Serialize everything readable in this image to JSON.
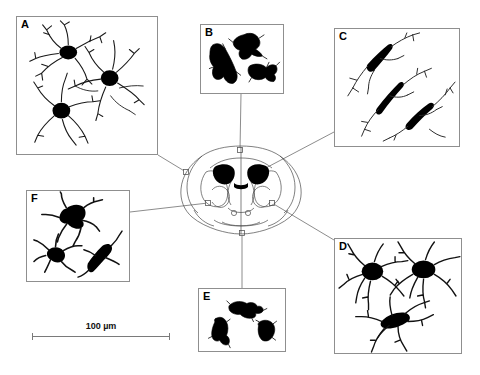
{
  "figure": {
    "background_color": "#ffffff",
    "ink_color": "#000000",
    "border_color": "#8f8f8f",
    "leader_color": "#6e6e6e"
  },
  "scale": {
    "label": "100 µm",
    "value": 100,
    "unit": "µm",
    "bar_length_px": 138
  },
  "panels": [
    {
      "id": "A",
      "label": "A",
      "morphology": "ramified",
      "cell_count": 3,
      "x": 16,
      "y": 16,
      "w": 142,
      "h": 139
    },
    {
      "id": "B",
      "label": "B",
      "morphology": "amoeboid-stout",
      "cell_count": 3,
      "x": 200,
      "y": 24,
      "w": 84,
      "h": 70
    },
    {
      "id": "C",
      "label": "C",
      "morphology": "elongated-bipolar",
      "cell_count": 3,
      "x": 334,
      "y": 28,
      "w": 126,
      "h": 119
    },
    {
      "id": "D",
      "label": "D",
      "morphology": "bushy-hyper-ramified",
      "cell_count": 3,
      "x": 334,
      "y": 238,
      "w": 128,
      "h": 116
    },
    {
      "id": "E",
      "label": "E",
      "morphology": "compact-amoeboid",
      "cell_count": 3,
      "x": 198,
      "y": 288,
      "w": 88,
      "h": 64
    },
    {
      "id": "F",
      "label": "F",
      "morphology": "stout-ramified",
      "cell_count": 3,
      "x": 26,
      "y": 190,
      "w": 104,
      "h": 92
    }
  ],
  "brain_section": {
    "view": "coronal",
    "outline_color": "#4a4a4a",
    "ventricle_fill": "#000000",
    "markers": [
      {
        "panel": "A",
        "x": 186,
        "y": 172
      },
      {
        "panel": "B",
        "x": 240,
        "y": 150
      },
      {
        "panel": "C",
        "x": 262,
        "y": 170
      },
      {
        "panel": "D",
        "x": 272,
        "y": 203
      },
      {
        "panel": "E",
        "x": 242,
        "y": 233
      },
      {
        "panel": "F",
        "x": 208,
        "y": 203
      }
    ]
  },
  "leader_lines": [
    {
      "panel": "A",
      "x1": 158,
      "y1": 155,
      "x2": 186,
      "y2": 172
    },
    {
      "panel": "B",
      "x1": 241,
      "y1": 94,
      "x2": 240,
      "y2": 150
    },
    {
      "panel": "C",
      "x1": 334,
      "y1": 132,
      "x2": 262,
      "y2": 170
    },
    {
      "panel": "D",
      "x1": 334,
      "y1": 240,
      "x2": 272,
      "y2": 203
    },
    {
      "panel": "E",
      "x1": 242,
      "y1": 288,
      "x2": 242,
      "y2": 233
    },
    {
      "panel": "F",
      "x1": 130,
      "y1": 212,
      "x2": 208,
      "y2": 203
    }
  ]
}
